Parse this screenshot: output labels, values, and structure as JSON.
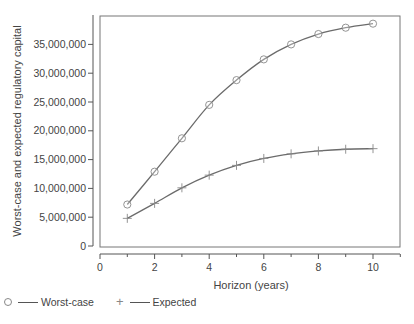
{
  "chart_data": {
    "type": "line",
    "title": "",
    "xlabel": "Horizon (years)",
    "ylabel": "Worst-case and expected regulatory capital",
    "xlim": [
      0,
      11
    ],
    "ylim": [
      0,
      40000000
    ],
    "x_ticks": [
      0,
      2,
      4,
      6,
      8,
      10
    ],
    "y_ticks": [
      0,
      5000000,
      10000000,
      15000000,
      20000000,
      25000000,
      30000000,
      35000000
    ],
    "y_tick_labels": [
      "0",
      "5,000,000",
      "10,000,000",
      "15,000,000",
      "20,000,000",
      "25,000,000",
      "30,000,000",
      "35,000,000"
    ],
    "x_tick_labels": [
      "0",
      "2",
      "4",
      "6",
      "8",
      "10"
    ],
    "grid": false,
    "legend_position": "bottom-left",
    "x": [
      1,
      2,
      3,
      4,
      5,
      6,
      7,
      8,
      9,
      10
    ],
    "series": [
      {
        "name": "Worst-case",
        "marker": "circle",
        "values": [
          7200000,
          12900000,
          18700000,
          24500000,
          28800000,
          32400000,
          35000000,
          36800000,
          37900000,
          38600000
        ]
      },
      {
        "name": "Expected",
        "marker": "plus",
        "values": [
          4800000,
          7400000,
          10100000,
          12300000,
          14000000,
          15200000,
          16000000,
          16500000,
          16800000,
          16900000
        ]
      }
    ]
  },
  "legend": {
    "worst_case_label": "Worst-case",
    "expected_label": "Expected"
  },
  "colors": {
    "line": "#6b6b6b",
    "marker": "#888888",
    "axis": "#555555"
  }
}
